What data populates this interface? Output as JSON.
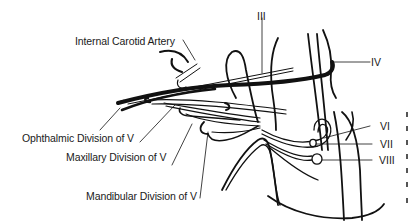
{
  "figure": {
    "labels": {
      "internal_carotid": "Internal Carotid Artery",
      "ophthalmic": "Ophthalmic Division of V",
      "maxillary": "Maxillary Division of V",
      "mandibular": "Mandibular Division of V",
      "nerve_iii": "III",
      "nerve_iv": "IV",
      "nerve_vi": "VI",
      "nerve_vii": "VII",
      "nerve_viii": "VIII"
    },
    "line_color": "#111111",
    "background": "#ffffff"
  }
}
